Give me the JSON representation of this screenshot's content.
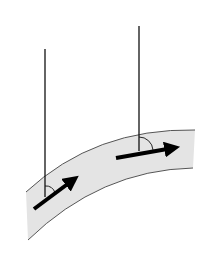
{
  "diagram": {
    "colors": {
      "background": "#ffffff",
      "band_fill": "#e4e4e4",
      "band_edge": "#555555",
      "line": "#111111",
      "arrow": "#000000"
    },
    "band": {
      "top_edge": "M26,192 Q95,128 195,130",
      "bottom_edge": "M28,240 Q100,170 193,168"
    },
    "verticals": [
      {
        "id": "left",
        "x": 45,
        "y1": 49,
        "y2": 197
      },
      {
        "id": "right",
        "x": 139,
        "y1": 26,
        "y2": 151
      }
    ],
    "arrows": [
      {
        "id": "left",
        "x1": 34,
        "y1": 209,
        "x2": 80,
        "y2": 175
      },
      {
        "id": "right",
        "x1": 116,
        "y1": 158,
        "x2": 182,
        "y2": 146
      }
    ],
    "angle_arcs": [
      {
        "id": "left",
        "path": "M45,188 A9,9 0 0 1 54,191"
      },
      {
        "id": "right",
        "path": "M139,138 A14,14 0 0 1 153,150"
      }
    ]
  }
}
